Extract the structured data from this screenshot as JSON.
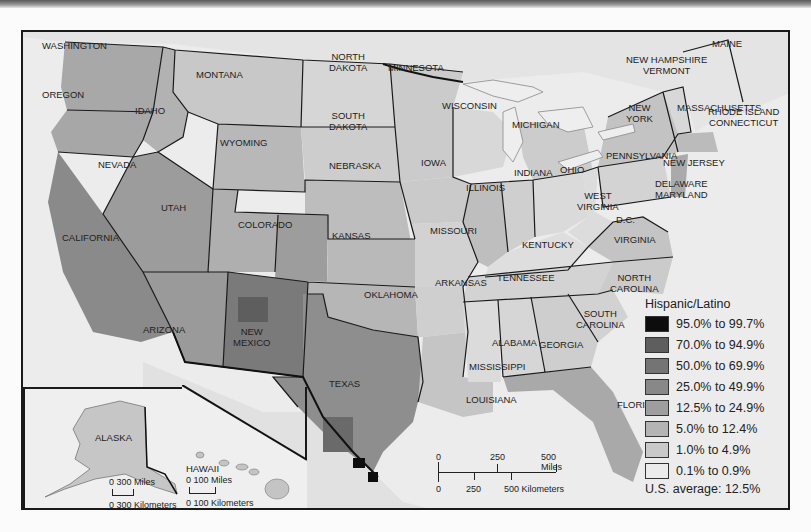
{
  "map": {
    "title": "Hispanic/Latino population share by county",
    "states": [
      {
        "name": "WASHINGTON",
        "x": 40,
        "y": 38
      },
      {
        "name": "OREGON",
        "x": 40,
        "y": 87
      },
      {
        "name": "IDAHO",
        "x": 133,
        "y": 103
      },
      {
        "name": "MONTANA",
        "x": 194,
        "y": 67
      },
      {
        "name": "WYOMING",
        "x": 218,
        "y": 135
      },
      {
        "name": "NORTH\nDAKOTA",
        "x": 327,
        "y": 49
      },
      {
        "name": "SOUTH\nDAKOTA",
        "x": 327,
        "y": 108
      },
      {
        "name": "MINNESOTA",
        "x": 386,
        "y": 60
      },
      {
        "name": "WISCONSIN",
        "x": 440,
        "y": 98
      },
      {
        "name": "MICHIGAN",
        "x": 510,
        "y": 117
      },
      {
        "name": "NEBRASKA",
        "x": 327,
        "y": 158
      },
      {
        "name": "IOWA",
        "x": 419,
        "y": 155
      },
      {
        "name": "ILLINOIS",
        "x": 464,
        "y": 180
      },
      {
        "name": "INDIANA",
        "x": 512,
        "y": 165
      },
      {
        "name": "OHIO",
        "x": 558,
        "y": 162
      },
      {
        "name": "NEVADA",
        "x": 96,
        "y": 157
      },
      {
        "name": "UTAH",
        "x": 159,
        "y": 200
      },
      {
        "name": "COLORADO",
        "x": 236,
        "y": 217
      },
      {
        "name": "CALIFORNIA",
        "x": 60,
        "y": 230
      },
      {
        "name": "KANSAS",
        "x": 330,
        "y": 228
      },
      {
        "name": "MISSOURI",
        "x": 428,
        "y": 223
      },
      {
        "name": "KENTUCKY",
        "x": 520,
        "y": 237
      },
      {
        "name": "WEST\nVIRGINIA",
        "x": 575,
        "y": 188
      },
      {
        "name": "D.C.",
        "x": 614,
        "y": 212
      },
      {
        "name": "VIRGINIA",
        "x": 612,
        "y": 232
      },
      {
        "name": "TENNESSEE",
        "x": 495,
        "y": 270
      },
      {
        "name": "NORTH\nCAROLINA",
        "x": 608,
        "y": 270
      },
      {
        "name": "ARKANSAS",
        "x": 433,
        "y": 275
      },
      {
        "name": "OKLAHOMA",
        "x": 362,
        "y": 287
      },
      {
        "name": "ARIZONA",
        "x": 141,
        "y": 322
      },
      {
        "name": "NEW\nMEXICO",
        "x": 231,
        "y": 324
      },
      {
        "name": "SOUTH\nCAROLINA",
        "x": 574,
        "y": 306
      },
      {
        "name": "ALABAMA",
        "x": 490,
        "y": 335
      },
      {
        "name": "GEORGIA",
        "x": 537,
        "y": 337
      },
      {
        "name": "MISSISSIPPI",
        "x": 467,
        "y": 359
      },
      {
        "name": "TEXAS",
        "x": 327,
        "y": 376
      },
      {
        "name": "LOUISIANA",
        "x": 464,
        "y": 392
      },
      {
        "name": "FLORIDA",
        "x": 615,
        "y": 397
      },
      {
        "name": "PENNSYLVANIA",
        "x": 604,
        "y": 148
      },
      {
        "name": "NEW\nYORK",
        "x": 624,
        "y": 100
      },
      {
        "name": "NEW HAMPSHIRE\nVERMONT",
        "x": 624,
        "y": 52
      },
      {
        "name": "MAINE",
        "x": 710,
        "y": 36
      },
      {
        "name": "MASSACHUSETTS",
        "x": 675,
        "y": 100
      },
      {
        "name": "RHODE ISLAND\nCONNECTICUT",
        "x": 706,
        "y": 104
      },
      {
        "name": "NEW JERSEY",
        "x": 661,
        "y": 155
      },
      {
        "name": "DELAWARE\nMARYLAND",
        "x": 653,
        "y": 176
      }
    ],
    "insets": {
      "alaska": {
        "label": "ALASKA",
        "scale_miles": "0   300 Miles",
        "scale_km": "0 300 Kilometers"
      },
      "hawaii": {
        "label": "HAWAII",
        "scale_miles": "0    100 Miles",
        "scale_km": "0  100 Kilometers"
      }
    },
    "scale_bar": {
      "miles_ticks": [
        "0",
        "250",
        "500 Miles"
      ],
      "km_ticks": [
        "0",
        "250",
        "500 Kilometers"
      ]
    }
  },
  "legend": {
    "title": "Hispanic/Latino",
    "items": [
      {
        "label": "95.0% to 99.7%",
        "color": "#0d0d0d"
      },
      {
        "label": "70.0% to 94.9%",
        "color": "#5e5e5e"
      },
      {
        "label": "50.0% to 69.9%",
        "color": "#747474"
      },
      {
        "label": "25.0% to 49.9%",
        "color": "#888888"
      },
      {
        "label": "12.5% to 24.9%",
        "color": "#9e9e9e"
      },
      {
        "label": "5.0% to 12.4%",
        "color": "#b4b4b4"
      },
      {
        "label": "1.0% to 4.9%",
        "color": "#c9c9c9"
      },
      {
        "label": "0.1% to 0.9%",
        "color": "#ebebeb"
      }
    ],
    "average": "U.S. average:  12.5%"
  }
}
